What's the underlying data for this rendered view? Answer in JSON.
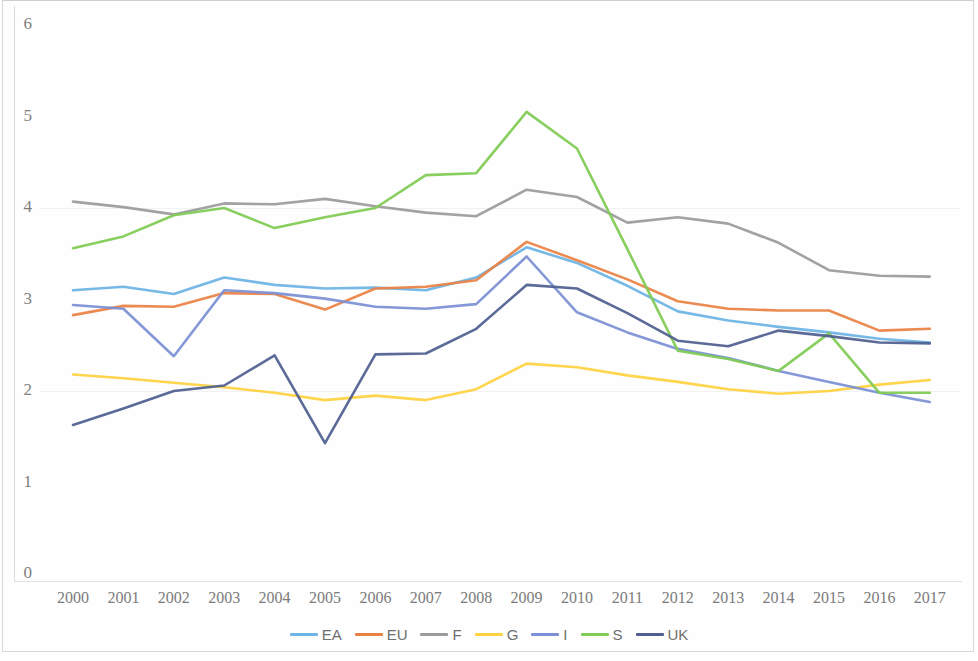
{
  "chart_data": {
    "type": "line",
    "title": "",
    "subtitle": "",
    "xlabel": "",
    "ylabel": "",
    "xlim": [
      2000,
      2017
    ],
    "ylim": [
      0,
      6
    ],
    "ytick_labels": [
      "0",
      "1",
      "2",
      "3",
      "4",
      "5",
      "6"
    ],
    "ytick_values": [
      0,
      1,
      2,
      3,
      4,
      5,
      6
    ],
    "grid": false,
    "legend_position": "bottom-center",
    "categories": [
      2000,
      2001,
      2002,
      2003,
      2004,
      2005,
      2006,
      2007,
      2008,
      2009,
      2010,
      2011,
      2012,
      2013,
      2014,
      2015,
      2016,
      2017
    ],
    "xtick_labels": [
      "2000",
      "2001",
      "2002",
      "2003",
      "2004",
      "2005",
      "2006",
      "2007",
      "2008",
      "2009",
      "2010",
      "2011",
      "2012",
      "2013",
      "2014",
      "2015",
      "2016",
      "2017"
    ],
    "series": [
      {
        "name": "EA",
        "color": "#6cb4e4",
        "values": [
          3.1,
          3.14,
          3.06,
          3.24,
          3.16,
          3.12,
          3.13,
          3.1,
          3.24,
          3.57,
          3.4,
          3.15,
          2.87,
          2.77,
          2.7,
          2.64,
          2.57,
          2.53
        ]
      },
      {
        "name": "EU",
        "color": "#ea8244",
        "values": [
          2.83,
          2.93,
          2.92,
          3.07,
          3.06,
          2.89,
          3.12,
          3.14,
          3.21,
          3.63,
          3.43,
          3.22,
          2.98,
          2.9,
          2.88,
          2.88,
          2.66,
          2.68
        ]
      },
      {
        "name": "F",
        "color": "#9b9b9b",
        "values": [
          4.07,
          4.01,
          3.93,
          4.05,
          4.04,
          4.1,
          4.02,
          3.95,
          3.91,
          4.2,
          4.12,
          3.84,
          3.9,
          3.83,
          3.62,
          3.32,
          3.26,
          3.25
        ]
      },
      {
        "name": "G",
        "color": "#ffd23f",
        "values": [
          2.18,
          2.14,
          2.09,
          2.04,
          1.98,
          1.9,
          1.95,
          1.9,
          2.02,
          2.3,
          2.26,
          2.17,
          2.1,
          2.02,
          1.97,
          2.0,
          2.07,
          2.12
        ]
      },
      {
        "name": "I",
        "color": "#7b8fd4"
      },
      {
        "name": "S",
        "color": "#7fcb53"
      },
      {
        "name": "UK",
        "color": "#4f5f8f"
      }
    ],
    "series_extra": {
      "I": [
        2.94,
        2.9,
        2.38,
        3.1,
        3.07,
        3.01,
        2.92,
        2.9,
        2.95,
        3.47,
        2.86,
        2.64,
        2.46,
        2.36,
        2.22,
        2.1,
        1.98,
        1.88
      ],
      "S": [
        3.56,
        3.69,
        3.92,
        4.0,
        3.78,
        3.9,
        4.0,
        4.36,
        4.38,
        5.05,
        4.65,
        3.55,
        2.44,
        2.35,
        2.22,
        2.63,
        1.98,
        1.98
      ],
      "UK": [
        1.63,
        1.81,
        2.0,
        2.06,
        2.39,
        1.43,
        2.4,
        2.41,
        2.68,
        3.16,
        3.12,
        2.85,
        2.55,
        2.49,
        2.66,
        2.6,
        2.53,
        2.52
      ]
    },
    "legend": [
      {
        "label": "EA",
        "color": "#6cb4e4"
      },
      {
        "label": "EU",
        "color": "#ea8244"
      },
      {
        "label": "F",
        "color": "#9b9b9b"
      },
      {
        "label": "G",
        "color": "#ffd23f"
      },
      {
        "label": "I",
        "color": "#7b8fd4"
      },
      {
        "label": "S",
        "color": "#7fcb53"
      },
      {
        "label": "UK",
        "color": "#4f5f8f"
      }
    ]
  }
}
